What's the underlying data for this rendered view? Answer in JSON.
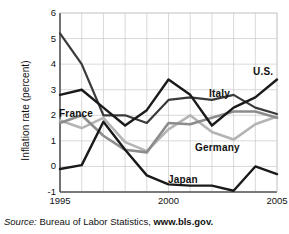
{
  "chart_data": {
    "type": "line",
    "title": "",
    "xlabel": "",
    "ylabel": "Inflation rate (percent)",
    "xlim": [
      1995,
      2005
    ],
    "ylim": [
      -1,
      6
    ],
    "grid": true,
    "legend_position": "inline-labels",
    "x": [
      1995,
      1996,
      1997,
      1998,
      1999,
      2000,
      2001,
      2002,
      2003,
      2004,
      2005
    ],
    "yticks": [
      6,
      5,
      4,
      3,
      2,
      1,
      0,
      -1
    ],
    "ytick_labels": [
      "6",
      "5",
      "4",
      "3",
      "2",
      "1",
      "0",
      "-1"
    ],
    "xticks": [
      1995,
      2000,
      2005
    ],
    "xtick_labels": [
      "1995",
      "2000",
      "2005"
    ],
    "series": [
      {
        "name": "Italy",
        "color": "#3a3a3a",
        "width": 2.2,
        "values": [
          5.2,
          4.0,
          2.0,
          2.0,
          1.7,
          2.6,
          2.7,
          2.6,
          2.8,
          2.3,
          2.05
        ]
      },
      {
        "name": "U.S.",
        "color": "#1a1a1a",
        "width": 2.4,
        "values": [
          2.8,
          3.0,
          2.3,
          1.6,
          2.2,
          3.4,
          2.8,
          1.6,
          2.3,
          2.7,
          3.4
        ]
      },
      {
        "name": "Japan",
        "color": "#1a1a1a",
        "width": 2.4,
        "values": [
          -0.1,
          0.05,
          1.75,
          0.65,
          -0.35,
          -0.7,
          -0.75,
          -0.75,
          -0.95,
          0.0,
          -0.3
        ]
      },
      {
        "name": "France",
        "color": "#8c8c8c",
        "width": 2.6,
        "values": [
          1.7,
          2.0,
          1.2,
          0.65,
          0.55,
          1.7,
          1.65,
          1.9,
          2.15,
          2.15,
          1.9
        ]
      },
      {
        "name": "Germany",
        "color": "#b4b4b4",
        "width": 2.6,
        "values": [
          1.8,
          1.5,
          1.9,
          0.95,
          0.6,
          1.45,
          2.0,
          1.35,
          1.05,
          1.65,
          1.95
        ]
      }
    ],
    "series_labels": [
      {
        "text": "U.S.",
        "x": 253,
        "y": 66
      },
      {
        "text": "Italy",
        "x": 209,
        "y": 88
      },
      {
        "text": "Germany",
        "x": 195,
        "y": 142
      },
      {
        "text": "Japan",
        "x": 168,
        "y": 174
      },
      {
        "text": "France",
        "x": 59,
        "y": 108
      }
    ]
  },
  "source": {
    "prefix": "Source:",
    "body": "Bureau of Labor Statistics,",
    "url": "www.bls.gov."
  }
}
